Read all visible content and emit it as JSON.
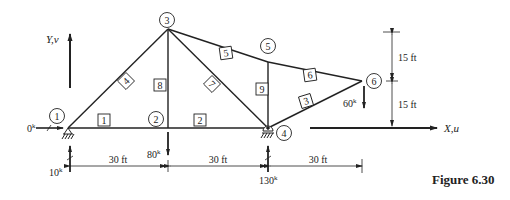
{
  "figure": {
    "caption": "Figure 6.30",
    "axes": {
      "y_label": "Y,v",
      "x_label": "X,u"
    },
    "nodes": [
      {
        "id": "1",
        "x": 68,
        "y": 128,
        "label_x": 58,
        "label_y": 116
      },
      {
        "id": "2",
        "x": 168,
        "y": 128,
        "label_x": 156,
        "label_y": 119
      },
      {
        "id": "3",
        "x": 168,
        "y": 29,
        "label_x": 166,
        "label_y": 20
      },
      {
        "id": "4",
        "x": 268,
        "y": 128,
        "label_x": 285,
        "label_y": 133
      },
      {
        "id": "5",
        "x": 268,
        "y": 62,
        "label_x": 267,
        "label_y": 46
      },
      {
        "id": "6",
        "x": 362,
        "y": 81,
        "label_x": 375,
        "label_y": 81
      }
    ],
    "members": [
      {
        "id": "1",
        "from": "1",
        "to": "2",
        "lx": 104,
        "ly": 120,
        "rot": 0
      },
      {
        "id": "2",
        "from": "2",
        "to": "4",
        "lx": 200,
        "ly": 120,
        "rot": 0
      },
      {
        "id": "3",
        "from": "4",
        "to": "6",
        "lx": 306,
        "ly": 101,
        "rot": -17
      },
      {
        "id": "4",
        "from": "1",
        "to": "3",
        "lx": 126,
        "ly": 81,
        "rot": -45
      },
      {
        "id": "5",
        "from": "3",
        "to": "5",
        "lx": 226,
        "ly": 52,
        "rot": 0
      },
      {
        "id": "6",
        "from": "5",
        "to": "6",
        "lx": 310,
        "ly": 74,
        "rot": 0
      },
      {
        "id": "7",
        "from": "3",
        "to": "4",
        "lx": 213,
        "ly": 83,
        "rot": 45
      },
      {
        "id": "8",
        "from": "2",
        "to": "3",
        "lx": 160,
        "ly": 86,
        "rot": 0
      },
      {
        "id": "9",
        "from": "4",
        "to": "5",
        "lx": 262,
        "ly": 89,
        "rot": 0
      }
    ],
    "loads": [
      {
        "node": "1",
        "label": "0",
        "unit": "k",
        "direction": "right"
      },
      {
        "node": "1",
        "label": "10",
        "unit": "k",
        "direction": "up"
      },
      {
        "node": "2",
        "label": "80",
        "unit": "k",
        "direction": "down"
      },
      {
        "node": "4",
        "label": "130",
        "unit": "k",
        "direction": "up"
      },
      {
        "node": "6",
        "label": "60",
        "unit": "k",
        "direction": "down"
      }
    ],
    "dimensions": {
      "horizontal": [
        "30 ft",
        "30 ft",
        "30 ft"
      ],
      "vertical": [
        "15 ft",
        "15 ft"
      ]
    }
  }
}
